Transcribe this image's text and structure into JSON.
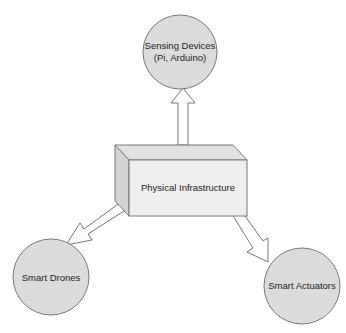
{
  "diagram": {
    "center": {
      "label": "Physical Infrastructure"
    },
    "nodes": [
      {
        "id": "sensing",
        "line1": "Sensing Devices",
        "line2": "(Pi, Arduino)"
      },
      {
        "id": "drones",
        "line1": "Smart Drones"
      },
      {
        "id": "actuators",
        "line1": "Smart Actuators"
      }
    ],
    "colors": {
      "node_fill": "#dcdcdc",
      "stroke": "#777777",
      "cube_front": "#efefef",
      "cube_top": "#e2e2e2",
      "cube_side": "#d4d4d4",
      "arrow_fill": "#ffffff"
    }
  }
}
